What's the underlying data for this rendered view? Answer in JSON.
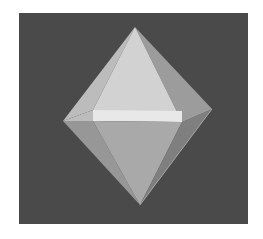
{
  "image": {
    "subject": "octahedron",
    "description": "Rendered grey octahedron on a dark grey square background"
  },
  "colors": {
    "page_background": "#ffffff",
    "panel_background": "#4a4a4a",
    "upper_front_face": "#d2d2d2",
    "upper_left_face": "#bcbcbc",
    "upper_right_face": "#9c9c9c",
    "equator_band": "#e8e8e8",
    "lower_front_face": "#a9a9a9",
    "lower_left_face": "#979797",
    "lower_right_face": "#7f7f7f",
    "edge_highlight": "#cfcfcf"
  },
  "geometry": {
    "panel": {
      "x": 19,
      "y": 13,
      "width": 229,
      "height": 211
    },
    "vertices": {
      "top": [
        135,
        27
      ],
      "bottom": [
        140,
        205
      ],
      "left": [
        63,
        121
      ],
      "front_left": [
        93,
        110
      ],
      "front_right": [
        182,
        122
      ],
      "right": [
        212,
        109
      ]
    }
  }
}
